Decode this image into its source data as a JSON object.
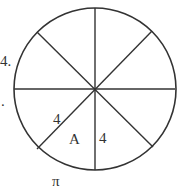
{
  "figure": {
    "type": "circle-divided-into-8-sectors",
    "circle": {
      "cx": 95,
      "cy": 89,
      "r": 81,
      "stroke": "#333333"
    },
    "spokes": 8,
    "labels": {
      "problem_number": "4.",
      "left_mark": ".",
      "radius_diagonal": "4",
      "radius_vertical": "4",
      "sector": "A",
      "arc": "π"
    }
  }
}
